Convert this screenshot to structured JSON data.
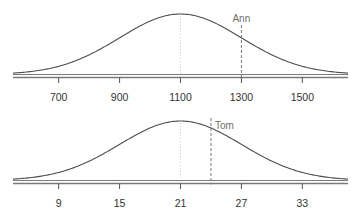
{
  "colors": {
    "curve": "#4d4d4d",
    "baseline": "#7a7a7a",
    "tick": "#555555",
    "tick_label": "#333333",
    "marker_line": "#666666",
    "marker_label": "#6e6e6e",
    "mean_line": "#d0d0d0",
    "background": "#ffffff"
  },
  "chart_data": [
    {
      "type": "line",
      "subtype": "normal-distribution",
      "title": "",
      "xlabel": "",
      "ylabel": "",
      "mean": 1100,
      "sd": 200,
      "xlim": [
        550,
        1650
      ],
      "x_ticks": [
        700,
        900,
        1100,
        1300,
        1500
      ],
      "tick_labels": [
        "700",
        "900",
        "1100",
        "1300",
        "1500"
      ],
      "grid": false,
      "mean_reference_line": 1100,
      "marker": {
        "label": "Ann",
        "x": 1300
      }
    },
    {
      "type": "line",
      "subtype": "normal-distribution",
      "title": "",
      "xlabel": "",
      "ylabel": "",
      "mean": 21,
      "sd": 6,
      "xlim": [
        4.5,
        37.5
      ],
      "x_ticks": [
        9,
        15,
        21,
        27,
        33
      ],
      "tick_labels": [
        "9",
        "15",
        "21",
        "27",
        "33"
      ],
      "grid": false,
      "mean_reference_line": 21,
      "marker": {
        "label": "Tom",
        "x": 24
      }
    }
  ]
}
